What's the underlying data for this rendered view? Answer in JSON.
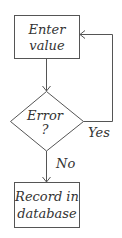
{
  "diagram": {
    "type": "flowchart",
    "nodes": [
      {
        "id": "enter",
        "shape": "rectangle",
        "line1": "Enter",
        "line2": "value"
      },
      {
        "id": "error",
        "shape": "diamond",
        "line1": "Error",
        "line2": "?"
      },
      {
        "id": "record",
        "shape": "rectangle",
        "line1": "Record in",
        "line2": "database"
      }
    ],
    "edges": [
      {
        "from": "enter",
        "to": "error",
        "label": ""
      },
      {
        "from": "error",
        "to": "enter",
        "label": "Yes"
      },
      {
        "from": "error",
        "to": "record",
        "label": "No"
      }
    ],
    "colors": {
      "stroke": "#555555",
      "text": "#333333",
      "background": "#ffffff"
    }
  }
}
